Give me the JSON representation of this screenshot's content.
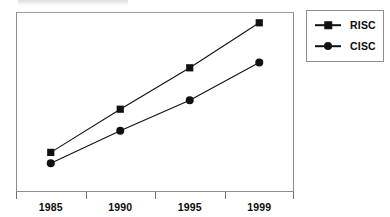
{
  "chart_data": {
    "type": "line",
    "title": "",
    "xlabel": "",
    "ylabel": "Performance",
    "categories": [
      "1985",
      "1990",
      "1995",
      "1999"
    ],
    "grid": false,
    "legend_position": "right",
    "y_ticks_shown": false,
    "x_axis_note": "Category labels centered between tick marks",
    "ylim": [
      0,
      100
    ],
    "series": [
      {
        "name": "RISC",
        "marker": "square",
        "color": "#111111",
        "values": [
          22,
          46,
          69,
          94
        ]
      },
      {
        "name": "CISC",
        "marker": "circle",
        "color": "#111111",
        "values": [
          16,
          34,
          51,
          72
        ]
      }
    ]
  },
  "axes": {
    "y_title": "Performance",
    "x_tick_labels": [
      "1985",
      "1990",
      "1995",
      "1999"
    ]
  },
  "legend": {
    "entries": [
      {
        "label": "RISC",
        "marker": "square-marker-icon"
      },
      {
        "label": "CISC",
        "marker": "circle-marker-icon"
      }
    ]
  },
  "colors": {
    "series": "#111111",
    "frame": "#8e8e8e",
    "text": "#0d0d0d",
    "background": "#ffffff"
  }
}
